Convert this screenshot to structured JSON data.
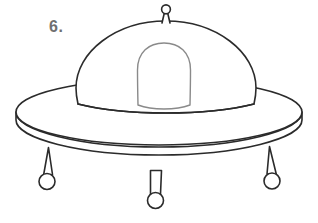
{
  "page": {
    "background_color": "#ffffff",
    "width": 318,
    "height": 223
  },
  "label": {
    "exercise_number": "6.",
    "color": "#6f6f6f"
  },
  "artwork": {
    "subject": "flying-saucer-ufo",
    "style": "black-and-white-outline-coloring-page",
    "stroke_color_primary": "#2b2b2b",
    "stroke_color_secondary": "#8a8a8a",
    "fill_color": "#ffffff",
    "stroke_width_primary": 1.6,
    "stroke_width_secondary": 1.4,
    "parts": [
      {
        "name": "antenna-knob",
        "shape": "circle",
        "cx": 166,
        "cy": 9,
        "r": 4.4
      },
      {
        "name": "antenna-stalk",
        "shape": "tapered-post",
        "top_left_x": 163.6,
        "top_right_x": 168.4,
        "top_y": 13.2,
        "bottom_left_x": 161.5,
        "bottom_right_x": 170.5,
        "bottom_y": 23
      },
      {
        "name": "dome",
        "shape": "semi-ellipse-with-flared-skirt",
        "center_x": 166,
        "apex_y": 21,
        "base_y": 97,
        "half_width_top": 82,
        "half_width_base": 88
      },
      {
        "name": "cockpit-window",
        "shape": "rounded-arch",
        "center_x": 164,
        "top_y": 43,
        "bottom_y": 105,
        "half_width": 26
      },
      {
        "name": "disc-top-surface",
        "shape": "ellipse",
        "cx": 159,
        "cy": 112,
        "rx": 143,
        "ry": 33
      },
      {
        "name": "disc-rim-thickness",
        "shape": "ellipse-band",
        "cx": 159,
        "cy": 120,
        "rx": 143,
        "ry": 33,
        "band_depth": 9
      },
      {
        "name": "landing-leg-left",
        "shape": "tapered-strut-with-foot",
        "top_x": 50,
        "top_y": 153,
        "foot_cx": 47,
        "foot_cy": 181,
        "foot_r": 8
      },
      {
        "name": "landing-leg-center",
        "shape": "tapered-strut-with-foot",
        "top_x": 156,
        "top_y": 172,
        "foot_cx": 155,
        "foot_cy": 200,
        "foot_r": 8
      },
      {
        "name": "landing-leg-right",
        "shape": "tapered-strut-with-foot",
        "top_x": 265,
        "top_y": 152,
        "foot_cx": 272,
        "foot_cy": 180,
        "foot_r": 8
      }
    ]
  }
}
